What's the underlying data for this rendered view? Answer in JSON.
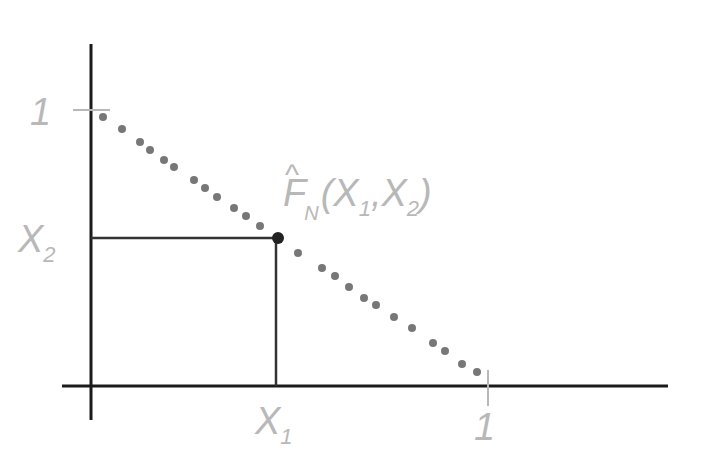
{
  "diagram": {
    "colors": {
      "axis": "#1a1a1a",
      "label": "#b8b8b8",
      "dots": "#777777",
      "point": "#222222",
      "tick": "#b8b8b8",
      "background": "#ffffff"
    },
    "labels": {
      "y_one": "1",
      "x_one": "1",
      "x1_main": "X",
      "x1_sub": "1",
      "x2_main": "X",
      "x2_sub": "2",
      "func_hat": "^",
      "func_main": "F",
      "func_sub": "N",
      "func_open": "(",
      "func_arg1": "X",
      "func_arg1_sub": "1",
      "func_comma": ",",
      "func_arg2": "X",
      "func_arg2_sub": "2",
      "func_close": ")"
    },
    "dots": [
      [
        103,
        117
      ],
      [
        122,
        129
      ],
      [
        140,
        142
      ],
      [
        150,
        150
      ],
      [
        164,
        160
      ],
      [
        174,
        167
      ],
      [
        194,
        180
      ],
      [
        205,
        188
      ],
      [
        217,
        197
      ],
      [
        234,
        208
      ],
      [
        246,
        216
      ],
      [
        260,
        226
      ],
      [
        298,
        253
      ],
      [
        322,
        268
      ],
      [
        335,
        276
      ],
      [
        349,
        287
      ],
      [
        364,
        298
      ],
      [
        376,
        305
      ],
      [
        394,
        317
      ],
      [
        412,
        328
      ],
      [
        433,
        343
      ],
      [
        445,
        351
      ],
      [
        462,
        364
      ],
      [
        477,
        372
      ]
    ],
    "point": [
      278,
      238
    ],
    "origin": [
      91,
      386
    ]
  }
}
